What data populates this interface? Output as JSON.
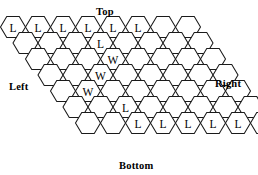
{
  "diagram": {
    "type": "hex-game-board",
    "title": "",
    "edge_labels": {
      "top": "Top",
      "bottom": "Bottom",
      "left": "Left",
      "right": "Right"
    },
    "grid": {
      "rows": 7,
      "cols": 8,
      "hex_width": 25,
      "hex_height": 21,
      "origin_x": 13,
      "origin_y": 27,
      "row_shift": 12.5,
      "col_step": 25,
      "row_step": 16
    },
    "colors": {
      "stroke": "#1a1a1a",
      "fill": "#ffffff",
      "text": "#000000"
    },
    "cells": [
      [
        {
          "r": 0,
          "c": 0,
          "mark": "L"
        },
        {
          "r": 0,
          "c": 1,
          "mark": "L"
        },
        {
          "r": 0,
          "c": 2,
          "mark": "L"
        },
        {
          "r": 0,
          "c": 3,
          "mark": "L"
        },
        {
          "r": 0,
          "c": 4,
          "mark": "L"
        },
        {
          "r": 0,
          "c": 5,
          "mark": "L"
        },
        {
          "r": 0,
          "c": 6,
          "mark": ""
        },
        {
          "r": 0,
          "c": 7,
          "mark": ""
        }
      ],
      [
        {
          "r": 1,
          "c": 0,
          "mark": ""
        },
        {
          "r": 1,
          "c": 1,
          "mark": ""
        },
        {
          "r": 1,
          "c": 2,
          "mark": ""
        },
        {
          "r": 1,
          "c": 3,
          "mark": "L"
        },
        {
          "r": 1,
          "c": 4,
          "mark": ""
        },
        {
          "r": 1,
          "c": 5,
          "mark": ""
        },
        {
          "r": 1,
          "c": 6,
          "mark": ""
        },
        {
          "r": 1,
          "c": 7,
          "mark": ""
        }
      ],
      [
        {
          "r": 2,
          "c": 0,
          "mark": ""
        },
        {
          "r": 2,
          "c": 1,
          "mark": ""
        },
        {
          "r": 2,
          "c": 2,
          "mark": ""
        },
        {
          "r": 2,
          "c": 3,
          "mark": "W"
        },
        {
          "r": 2,
          "c": 4,
          "mark": ""
        },
        {
          "r": 2,
          "c": 5,
          "mark": ""
        },
        {
          "r": 2,
          "c": 6,
          "mark": ""
        },
        {
          "r": 2,
          "c": 7,
          "mark": ""
        }
      ],
      [
        {
          "r": 3,
          "c": 0,
          "mark": ""
        },
        {
          "r": 3,
          "c": 1,
          "mark": ""
        },
        {
          "r": 3,
          "c": 2,
          "mark": "W"
        },
        {
          "r": 3,
          "c": 3,
          "mark": ""
        },
        {
          "r": 3,
          "c": 4,
          "mark": ""
        },
        {
          "r": 3,
          "c": 5,
          "mark": ""
        },
        {
          "r": 3,
          "c": 6,
          "mark": ""
        },
        {
          "r": 3,
          "c": 7,
          "mark": ""
        }
      ],
      [
        {
          "r": 4,
          "c": 0,
          "mark": ""
        },
        {
          "r": 4,
          "c": 1,
          "mark": "W"
        },
        {
          "r": 4,
          "c": 2,
          "mark": ""
        },
        {
          "r": 4,
          "c": 3,
          "mark": ""
        },
        {
          "r": 4,
          "c": 4,
          "mark": ""
        },
        {
          "r": 4,
          "c": 5,
          "mark": ""
        },
        {
          "r": 4,
          "c": 6,
          "mark": ""
        },
        {
          "r": 4,
          "c": 7,
          "mark": ""
        }
      ],
      [
        {
          "r": 5,
          "c": 0,
          "mark": ""
        },
        {
          "r": 5,
          "c": 1,
          "mark": ""
        },
        {
          "r": 5,
          "c": 2,
          "mark": "L"
        },
        {
          "r": 5,
          "c": 3,
          "mark": ""
        },
        {
          "r": 5,
          "c": 4,
          "mark": ""
        },
        {
          "r": 5,
          "c": 5,
          "mark": ""
        },
        {
          "r": 5,
          "c": 6,
          "mark": ""
        },
        {
          "r": 5,
          "c": 7,
          "mark": ""
        }
      ],
      [
        {
          "r": 6,
          "c": 0,
          "mark": ""
        },
        {
          "r": 6,
          "c": 1,
          "mark": ""
        },
        {
          "r": 6,
          "c": 2,
          "mark": "L"
        },
        {
          "r": 6,
          "c": 3,
          "mark": "L"
        },
        {
          "r": 6,
          "c": 4,
          "mark": "L"
        },
        {
          "r": 6,
          "c": 5,
          "mark": "L"
        },
        {
          "r": 6,
          "c": 6,
          "mark": "L"
        },
        {
          "r": 6,
          "c": 7,
          "mark": "L"
        }
      ]
    ]
  }
}
